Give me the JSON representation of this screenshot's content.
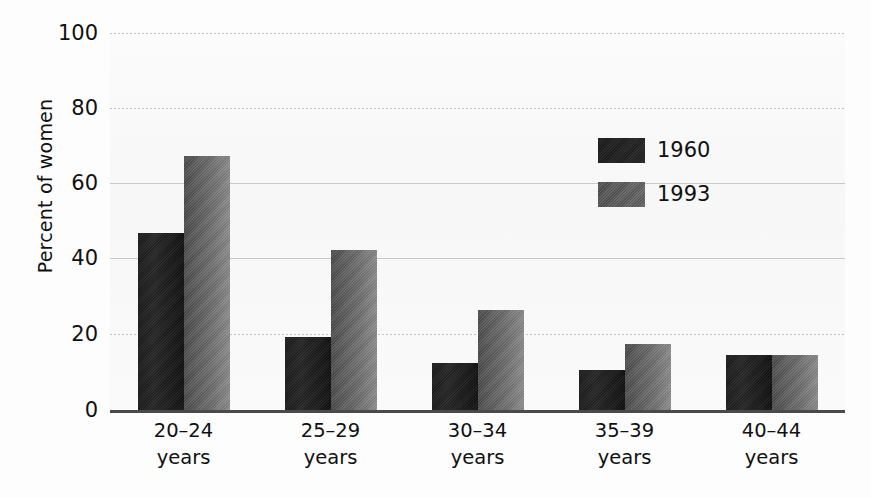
{
  "chart_data": {
    "type": "bar",
    "title": "",
    "subtitle": "",
    "xlabel": "",
    "ylabel": "Percent of women",
    "ylim": [
      0,
      100
    ],
    "yticks": [
      0,
      20,
      40,
      60,
      80,
      100
    ],
    "ytick_labels": [
      "0",
      "20",
      "40",
      "60",
      "80",
      "100"
    ],
    "grid": true,
    "grid_axis": "y",
    "legend_position": "upper-right-inside",
    "categories": [
      "20–24\nyears",
      "25–29\nyears",
      "30–34\nyears",
      "35–39\nyears",
      "40–44\nyears"
    ],
    "category_lines": [
      {
        "line1": "20–24",
        "line2": "years"
      },
      {
        "line1": "25–29",
        "line2": "years"
      },
      {
        "line1": "30–34",
        "line2": "years"
      },
      {
        "line1": "35–39",
        "line2": "years"
      },
      {
        "line1": "40–44",
        "line2": "years"
      }
    ],
    "series": [
      {
        "name": "1960",
        "color": "#1f1f1f",
        "values": [
          47,
          19.5,
          12.5,
          10.5,
          14.5
        ]
      },
      {
        "name": "1993",
        "color": "#6b6b6b",
        "values": [
          67.5,
          42.5,
          26.5,
          17.5,
          14.5
        ]
      }
    ]
  },
  "legend": {
    "items": [
      {
        "label": "1960",
        "swatch": "legend-swatch-1960"
      },
      {
        "label": "1993",
        "swatch": "legend-swatch-1993"
      }
    ]
  },
  "axes": {
    "y_title": "Percent of women",
    "y_tick_labels": [
      "100",
      "80",
      "60",
      "40",
      "20",
      "0"
    ]
  },
  "colors": {
    "series_1960": "#1f1f1f",
    "series_1993": "#6b6b6b",
    "axis_line": "#4a4a4a",
    "gridline": "#b9b9b9",
    "background": "#fdfdfd",
    "plot_background": "#f8f8f8",
    "text": "#101010"
  }
}
